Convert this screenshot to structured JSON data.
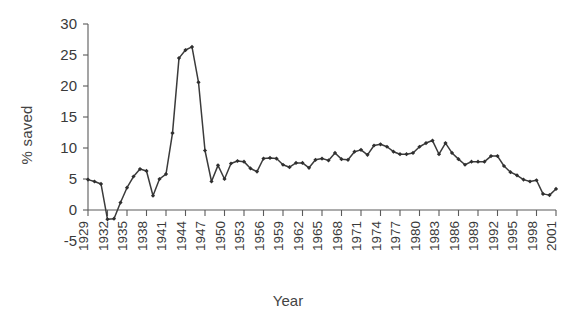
{
  "chart_data": {
    "type": "line",
    "title": "",
    "xlabel": "Year",
    "ylabel": "% saved",
    "xlim": [
      1929,
      2001
    ],
    "ylim": [
      -5,
      30
    ],
    "grid": false,
    "legend": false,
    "line_color": "#3b3b3b",
    "marker": "diamond",
    "marker_color": "#2f2f2f",
    "ytick_labels": [
      "30",
      "25",
      "20",
      "15",
      "10",
      "5",
      "0",
      "-5"
    ],
    "ytick_values": [
      30,
      25,
      20,
      15,
      10,
      5,
      0,
      -5
    ],
    "xtick_labels": [
      "1929",
      "1932",
      "1935",
      "1938",
      "1941",
      "1944",
      "1947",
      "1950",
      "1953",
      "1956",
      "1959",
      "1962",
      "1965",
      "1968",
      "1971",
      "1974",
      "1977",
      "1980",
      "1983",
      "1986",
      "1989",
      "1992",
      "1995",
      "1998",
      "2001"
    ],
    "xtick_values": [
      1929,
      1932,
      1935,
      1938,
      1941,
      1944,
      1947,
      1950,
      1953,
      1956,
      1959,
      1962,
      1965,
      1968,
      1971,
      1974,
      1977,
      1980,
      1983,
      1986,
      1989,
      1992,
      1995,
      1998,
      2001
    ],
    "x": [
      1929,
      1930,
      1931,
      1932,
      1933,
      1934,
      1935,
      1936,
      1937,
      1938,
      1939,
      1940,
      1941,
      1942,
      1943,
      1944,
      1945,
      1946,
      1947,
      1948,
      1949,
      1950,
      1951,
      1952,
      1953,
      1954,
      1955,
      1956,
      1957,
      1958,
      1959,
      1960,
      1961,
      1962,
      1963,
      1964,
      1965,
      1966,
      1967,
      1968,
      1969,
      1970,
      1971,
      1972,
      1973,
      1974,
      1975,
      1976,
      1977,
      1978,
      1979,
      1980,
      1981,
      1982,
      1983,
      1984,
      1985,
      1986,
      1987,
      1988,
      1989,
      1990,
      1991,
      1992,
      1993,
      1994,
      1995,
      1996,
      1997,
      1998,
      1999,
      2000,
      2001
    ],
    "values": [
      4.9,
      4.6,
      4.2,
      -1.5,
      -1.4,
      1.2,
      3.6,
      5.4,
      6.6,
      6.3,
      2.3,
      5.0,
      5.8,
      12.4,
      24.5,
      25.8,
      26.3,
      20.6,
      9.6,
      4.6,
      7.2,
      5.0,
      7.5,
      7.9,
      7.8,
      6.7,
      6.2,
      8.3,
      8.4,
      8.3,
      7.3,
      6.9,
      7.6,
      7.6,
      6.8,
      8.1,
      8.3,
      8.0,
      9.2,
      8.2,
      8.1,
      9.4,
      9.7,
      8.9,
      10.4,
      10.6,
      10.2,
      9.4,
      9.0,
      9.0,
      9.2,
      10.2,
      10.8,
      11.2,
      9.0,
      10.8,
      9.2,
      8.2,
      7.3,
      7.8,
      7.8,
      7.8,
      8.7,
      8.7,
      7.1,
      6.1,
      5.6,
      4.9,
      4.6,
      4.8,
      2.6,
      2.4,
      3.4
    ]
  }
}
